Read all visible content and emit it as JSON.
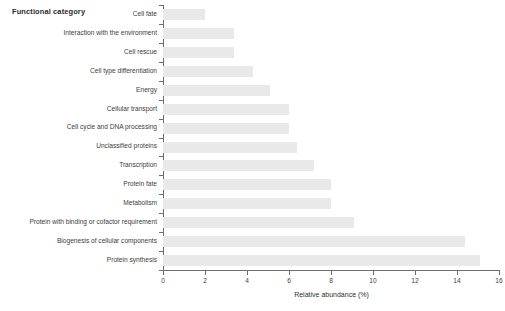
{
  "chart_data": {
    "type": "bar",
    "orientation": "horizontal",
    "title": "",
    "xlabel": "Relative abundance (%)",
    "ylabel": "Functional category",
    "xlim": [
      0,
      16
    ],
    "xticks": [
      0,
      2,
      4,
      6,
      8,
      10,
      12,
      14,
      16
    ],
    "grid": false,
    "legend": null,
    "bar_color": "#e9e9e9",
    "axis_color": "#6d6d6d",
    "categories": [
      "Cell fate",
      "Interaction with the environment",
      "Cell rescue",
      "Cell type differentiation",
      "Energy",
      "Cellular transport",
      "Cell cycle and DNA processing",
      "Unclassified proteins",
      "Transcription",
      "Protein fate",
      "Metabolism",
      "Protein with binding or cofactor requirement",
      "Biogenesis of cellular components",
      "Protein synthesis"
    ],
    "values": [
      2.0,
      3.4,
      3.4,
      4.3,
      5.1,
      6.0,
      6.0,
      6.4,
      7.2,
      8.0,
      8.0,
      9.1,
      14.4,
      15.1
    ]
  }
}
